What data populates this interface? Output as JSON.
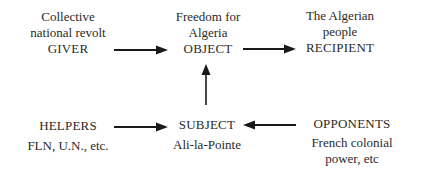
{
  "diagram": {
    "nodes": {
      "giver": {
        "lines": [
          "Collective",
          "national revolt"
        ],
        "role": "GIVER"
      },
      "object": {
        "lines": [
          "Freedom for",
          "Algeria"
        ],
        "role": "OBJECT"
      },
      "recipient": {
        "lines": [
          "The Algerian",
          "people"
        ],
        "role": "RECIPIENT"
      },
      "helpers": {
        "role": "HELPERS",
        "lines": [
          "FLN, U.N., etc."
        ]
      },
      "subject": {
        "role": "SUBJECT",
        "lines": [
          "Ali-la-Pointe"
        ]
      },
      "opponents": {
        "role": "OPPONENTS",
        "lines": [
          "French colonial",
          "power, etc"
        ]
      }
    },
    "edges": [
      {
        "from": "giver",
        "to": "object"
      },
      {
        "from": "object",
        "to": "recipient"
      },
      {
        "from": "subject",
        "to": "object"
      },
      {
        "from": "helpers",
        "to": "subject"
      },
      {
        "from": "opponents",
        "to": "subject"
      }
    ],
    "colors": {
      "text": "#2a2a2a",
      "arrow": "#1a1a1a",
      "background": "#ffffff"
    }
  }
}
